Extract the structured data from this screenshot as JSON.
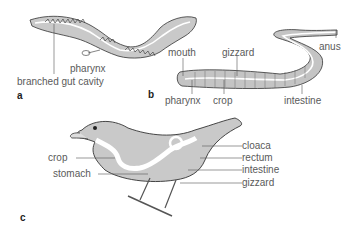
{
  "colors": {
    "body_fill": "#c9c9c9",
    "outline": "#333333",
    "gut": "#ffffff",
    "leader": "#555555",
    "text": "#5a5a5a"
  },
  "panels": {
    "a": {
      "letter": "a",
      "subject": "flatworm",
      "labels": {
        "pharynx": "pharynx",
        "branched_gut": "branched gut cavity"
      }
    },
    "b": {
      "letter": "b",
      "subject": "earthworm",
      "labels": {
        "mouth": "mouth",
        "gizzard": "gizzard",
        "anus": "anus",
        "pharynx": "pharynx",
        "crop": "crop",
        "intestine": "intestine"
      }
    },
    "c": {
      "letter": "c",
      "subject": "bird",
      "labels": {
        "crop": "crop",
        "stomach": "stomach",
        "cloaca": "cloaca",
        "rectum": "rectum",
        "intestine": "intestine",
        "gizzard": "gizzard"
      }
    }
  }
}
